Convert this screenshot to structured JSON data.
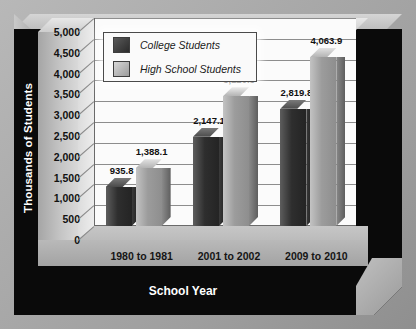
{
  "chart_data": {
    "type": "bar",
    "title": "",
    "xlabel": "School Year",
    "ylabel": "Thousands of Students",
    "categories": [
      "1980 to 1981",
      "2001 to 2002",
      "2009 to 2010"
    ],
    "series": [
      {
        "name": "College Students",
        "values": [
          935.8,
          2147.1,
          2819.8
        ],
        "labels": [
          "935.8",
          "2,147.1",
          "2,819.8"
        ],
        "color": "#2e2e2e"
      },
      {
        "name": "High School Students",
        "values": [
          1388.1,
          3120.5,
          4063.9
        ],
        "labels": [
          "1,388.1",
          "3,120.5",
          "4,063.9"
        ],
        "color": "#9c9c9c"
      }
    ],
    "ylim": [
      0,
      5000
    ],
    "ytick_step": 500,
    "ytick_labels": [
      "5,000",
      "4,500",
      "4,000",
      "3,500",
      "3,000",
      "2,500",
      "2,000",
      "1,500",
      "1,000",
      "500",
      "0"
    ],
    "grid": true,
    "legend_position": "top-left",
    "style": "3d-column"
  },
  "axes": {
    "y_title": "Thousands of Students",
    "x_title": "School Year"
  },
  "legend": {
    "entries": [
      {
        "label": "College Students",
        "swatch": "dark-swatch"
      },
      {
        "label": "High School Students",
        "swatch": "light-swatch"
      }
    ]
  },
  "colors": {
    "frame": "#0a0a0a",
    "background": "#a9a9a9",
    "plot_area": "#fbfbfb",
    "college_bar": "#2e2e2e",
    "high_school_bar": "#9c9c9c",
    "axis_text": "#111111",
    "title_text": "#ffffff"
  }
}
